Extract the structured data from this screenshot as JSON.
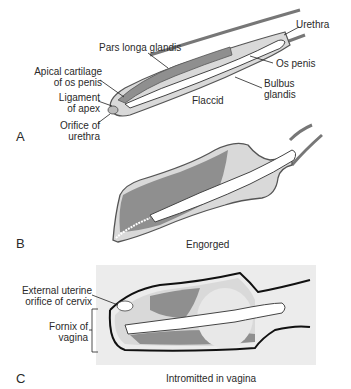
{
  "panels": [
    {
      "letter": "A",
      "caption": "Flaccid",
      "labels": {
        "urethra": "Urethra",
        "pars_longa": "Pars longa glandis",
        "os_penis": "Os penis",
        "apical_1": "Apical cartilage",
        "apical_2": "of os penis",
        "bulbus_1": "Bulbus",
        "bulbus_2": "glandis",
        "ligament_1": "Ligament",
        "ligament_2": "of apex",
        "orifice_1": "Orifice of",
        "orifice_2": "urethra"
      }
    },
    {
      "letter": "B",
      "caption": "Engorged"
    },
    {
      "letter": "C",
      "caption": "Intromitted in vagina",
      "labels": {
        "external_1": "External uterine",
        "external_2": "orifice of cervix",
        "fornix_1": "Fornix of",
        "fornix_2": "vagina"
      }
    }
  ],
  "colors": {
    "dark_tissue": "#8f8f8f",
    "light_tissue": "#d9d9d9",
    "bone": "#ffffff",
    "outline": "#555555",
    "vagina_bg": "#ececec"
  }
}
